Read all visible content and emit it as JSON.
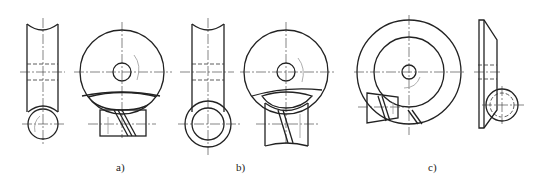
{
  "figure": {
    "type": "technical-drawing",
    "panels": [
      {
        "id": "a",
        "label": "a)"
      },
      {
        "id": "b",
        "label": "b)"
      },
      {
        "id": "c",
        "label": "c)"
      }
    ]
  }
}
